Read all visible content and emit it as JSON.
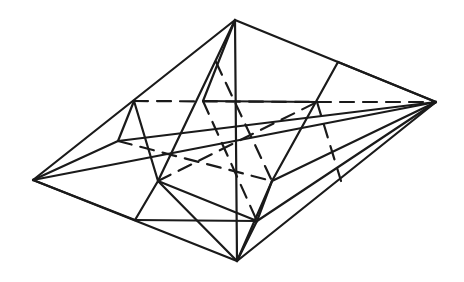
{
  "figure": {
    "stroke_color": "#1a1a1a",
    "background": "#ffffff",
    "vertices": {
      "T": [
        235,
        20
      ],
      "R": [
        436,
        102
      ],
      "B": [
        237,
        261
      ],
      "L": [
        33,
        180
      ],
      "A1": [
        134,
        101
      ],
      "A2": [
        118,
        141
      ],
      "A3": [
        135,
        220
      ],
      "C1": [
        158,
        181
      ],
      "D": [
        203,
        101
      ],
      "E": [
        216,
        62
      ],
      "F": [
        338,
        62
      ],
      "G": [
        317,
        102
      ],
      "H": [
        272,
        181
      ],
      "J": [
        257,
        221
      ],
      "K": [
        350,
        142
      ],
      "M": [
        341,
        181
      ]
    },
    "solid_edges": [
      [
        "T",
        "R"
      ],
      [
        "R",
        "B"
      ],
      [
        "B",
        "L"
      ],
      [
        "L",
        "T"
      ],
      [
        "L",
        "R"
      ],
      [
        "T",
        "D"
      ],
      [
        "D",
        "G"
      ],
      [
        "T",
        "B"
      ],
      [
        "A1",
        "A2"
      ],
      [
        "A1",
        "C1"
      ],
      [
        "A2",
        "L"
      ],
      [
        "A2",
        "R"
      ],
      [
        "L",
        "A3"
      ],
      [
        "A3",
        "C1"
      ],
      [
        "C1",
        "T"
      ],
      [
        "C1",
        "B"
      ],
      [
        "A3",
        "J"
      ],
      [
        "J",
        "H"
      ],
      [
        "H",
        "F"
      ],
      [
        "F",
        "R"
      ],
      [
        "H",
        "R"
      ],
      [
        "J",
        "R"
      ],
      [
        "J",
        "B"
      ],
      [
        "H",
        "B"
      ],
      [
        "C1",
        "J"
      ]
    ],
    "dashed_edges": [
      [
        "A1",
        "G"
      ],
      [
        "G",
        "R"
      ],
      [
        "A2",
        "H"
      ],
      [
        "D",
        "J"
      ],
      [
        "G",
        "M"
      ],
      [
        "E",
        "H"
      ],
      [
        "C1",
        "G"
      ]
    ]
  }
}
